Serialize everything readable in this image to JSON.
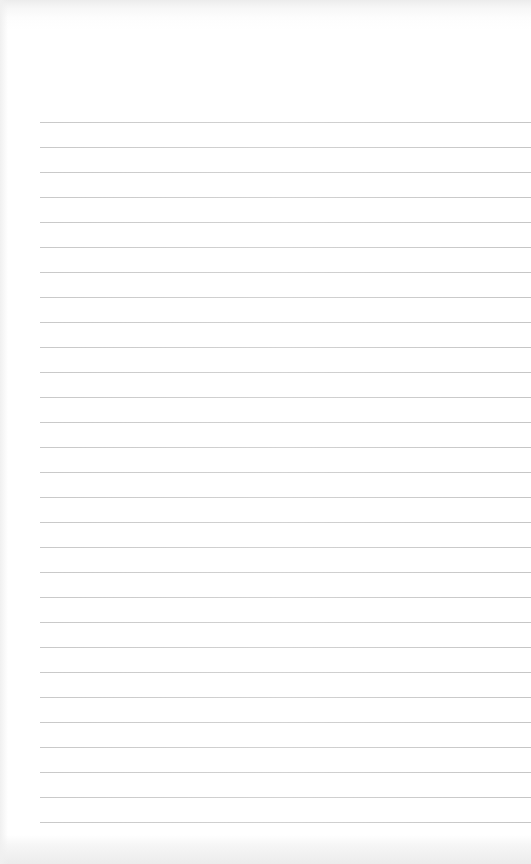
{
  "page": {
    "type": "lined-paper",
    "background_color": "#ffffff",
    "rule_color": "#cccccc",
    "rules": {
      "count": 29,
      "first_y": 122,
      "spacing": 25,
      "left_x": 40
    },
    "text": []
  }
}
